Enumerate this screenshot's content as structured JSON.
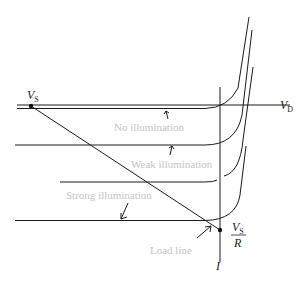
{
  "diagram": {
    "type": "photodiode I-V characteristics with load line",
    "axes": {
      "horizontal_label": "V",
      "horizontal_sub": "D",
      "vertical_label": "I"
    },
    "points": {
      "vs_label": "V",
      "vs_sub": "S",
      "vsr_num": "V",
      "vsr_num_sub": "S",
      "vsr_den": "R"
    },
    "curve_labels": {
      "no_illumination": "No illumination",
      "weak_illumination": "Weak illumination",
      "strong_illumination": "Strong illumination",
      "load_line": "Load line"
    },
    "colors": {
      "line": "#1a1a1a",
      "label_gray": "#c4c4c4"
    }
  }
}
